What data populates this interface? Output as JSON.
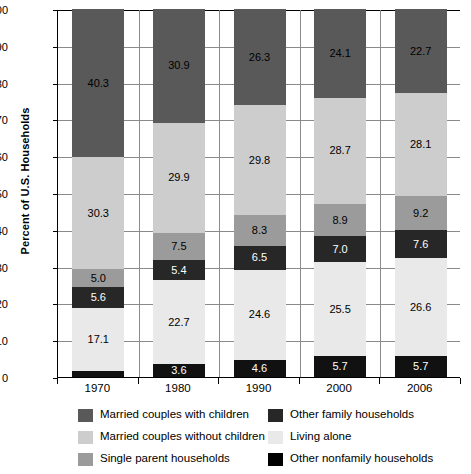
{
  "chart_data": {
    "type": "bar",
    "subtype": "stacked-bar-100-percent",
    "title": "",
    "xlabel": "",
    "ylabel": "Percent of U.S. Households",
    "ylim": [
      0,
      100
    ],
    "yticks": [
      0,
      10,
      20,
      30,
      40,
      50,
      60,
      70,
      80,
      90,
      100
    ],
    "ytick_labels": [
      "0",
      "10",
      "20",
      "30",
      "40",
      "50",
      "60",
      "70",
      "80",
      "90",
      "100"
    ],
    "grid": true,
    "grid_axis": "y",
    "legend_position": "bottom",
    "categories": [
      "1970",
      "1980",
      "1990",
      "2000",
      "2006"
    ],
    "stack_order_bottom_to_top": [
      "Other nonfamily households",
      "Living alone",
      "Other family households",
      "Single parent households",
      "Married couples without children",
      "Married couples with children"
    ],
    "series": [
      {
        "name": "Other nonfamily households",
        "color": "#111111",
        "values": [
          1.7,
          3.6,
          4.6,
          5.7,
          5.7
        ],
        "labels": [
          "",
          "3.6",
          "4.6",
          "5.7",
          "5.7"
        ],
        "label_colors": [
          "#ffffff",
          "#ffffff",
          "#ffffff",
          "#ffffff",
          "#ffffff"
        ]
      },
      {
        "name": "Living alone",
        "color": "#e9e9e9",
        "values": [
          17.1,
          22.7,
          24.6,
          25.5,
          26.6
        ],
        "labels": [
          "17.1",
          "22.7",
          "24.6",
          "25.5",
          "26.6"
        ],
        "label_colors": [
          "#000000",
          "#000000",
          "#000000",
          "#000000",
          "#000000"
        ]
      },
      {
        "name": "Other family households",
        "color": "#272727",
        "values": [
          5.6,
          5.4,
          6.5,
          7.0,
          7.6
        ],
        "labels": [
          "5.6",
          "5.4",
          "6.5",
          "7.0",
          "7.6"
        ],
        "label_colors": [
          "#ffffff",
          "#ffffff",
          "#ffffff",
          "#ffffff",
          "#ffffff"
        ]
      },
      {
        "name": "Single parent households",
        "color": "#9b9b9b",
        "values": [
          5.0,
          7.5,
          8.3,
          8.9,
          9.2
        ],
        "labels": [
          "5.0",
          "7.5",
          "8.3",
          "8.9",
          "9.2"
        ],
        "label_colors": [
          "#000000",
          "#000000",
          "#000000",
          "#000000",
          "#000000"
        ]
      },
      {
        "name": "Married couples without children",
        "color": "#cdcdcd",
        "values": [
          30.3,
          29.9,
          29.8,
          28.7,
          28.1
        ],
        "labels": [
          "30.3",
          "29.9",
          "29.8",
          "28.7",
          "28.1"
        ],
        "label_colors": [
          "#000000",
          "#000000",
          "#000000",
          "#000000",
          "#000000"
        ]
      },
      {
        "name": "Married couples with children",
        "color": "#595959",
        "values": [
          40.3,
          30.9,
          26.3,
          24.1,
          22.7
        ],
        "labels": [
          "40.3",
          "30.9",
          "26.3",
          "24.1",
          "22.7"
        ],
        "label_colors": [
          "#000000",
          "#000000",
          "#000000",
          "#000000",
          "#000000"
        ]
      }
    ]
  },
  "legend": {
    "items": [
      {
        "label": "Married couples with children",
        "color": "#595959",
        "column": 0
      },
      {
        "label": "Other family households",
        "color": "#272727",
        "column": 1
      },
      {
        "label": "Married couples without children",
        "color": "#cdcdcd",
        "column": 0
      },
      {
        "label": "Living alone",
        "color": "#e9e9e9",
        "column": 1
      },
      {
        "label": "Single parent households",
        "color": "#9b9b9b",
        "column": 0
      },
      {
        "label": "Other nonfamily households",
        "color": "#000000",
        "column": 1
      }
    ]
  }
}
